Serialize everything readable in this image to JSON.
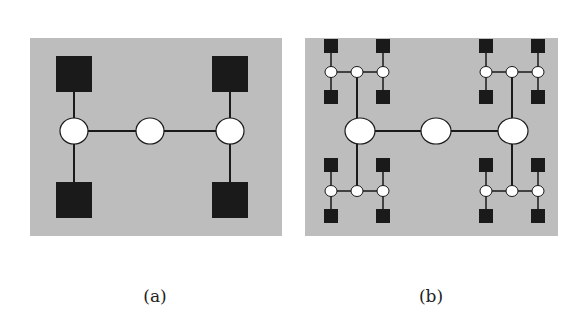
{
  "figure": {
    "background_color": "#bdbdbd",
    "square_color": "#1a1a1a",
    "circle_fill": "#ffffff",
    "line_color": "#1a1a1a"
  },
  "panels": [
    {
      "id": "a",
      "caption": "(a)",
      "iteration": 1,
      "panel_rect": {
        "x": 30,
        "y": 38,
        "w": 252,
        "h": 198
      },
      "circles": [
        {
          "cx": 74,
          "cy": 131,
          "rx": 14,
          "ry": 13
        },
        {
          "cx": 150,
          "cy": 131,
          "rx": 14,
          "ry": 13
        },
        {
          "cx": 230,
          "cy": 131,
          "rx": 14,
          "ry": 13
        }
      ],
      "squares": [
        {
          "x": 56,
          "y": 56,
          "s": 36
        },
        {
          "x": 212,
          "y": 56,
          "s": 36
        },
        {
          "x": 56,
          "y": 182,
          "s": 36
        },
        {
          "x": 212,
          "y": 182,
          "s": 36
        }
      ]
    },
    {
      "id": "b",
      "caption": "(b)",
      "iteration": 2,
      "panel_rect": {
        "x": 305,
        "y": 38,
        "w": 253,
        "h": 198
      },
      "big_circles": [
        {
          "cx": 360,
          "cy": 131,
          "rx": 15,
          "ry": 13
        },
        {
          "cx": 436,
          "cy": 131,
          "rx": 15,
          "ry": 13
        },
        {
          "cx": 513,
          "cy": 131,
          "rx": 15,
          "ry": 13
        }
      ],
      "sub_trees": [
        {
          "name": "top-left",
          "cx": 357,
          "cy": 72
        },
        {
          "name": "top-right",
          "cx": 512,
          "cy": 72
        },
        {
          "name": "bottom-left",
          "cx": 357,
          "cy": 191
        },
        {
          "name": "bottom-right",
          "cx": 512,
          "cy": 191
        }
      ]
    }
  ],
  "captions": {
    "a": "(a)",
    "b": "(b)"
  }
}
